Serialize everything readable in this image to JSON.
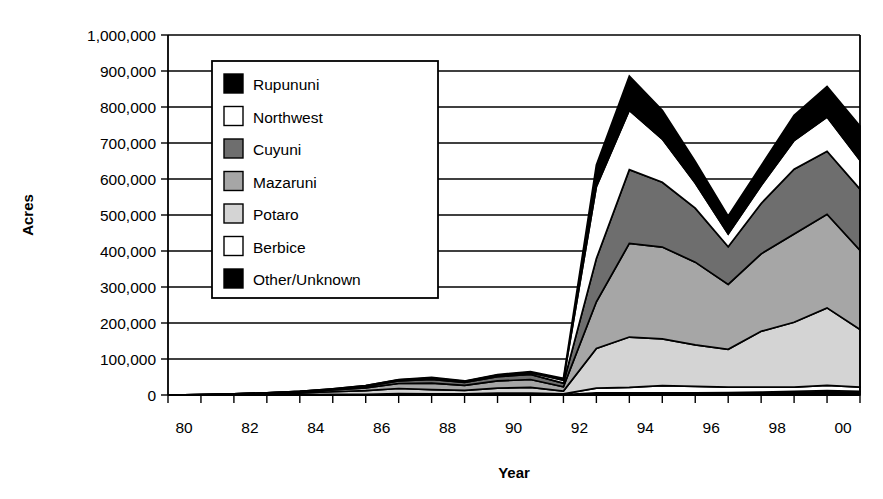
{
  "chart_data": {
    "type": "area",
    "stacked": true,
    "title": "",
    "xlabel": "Year",
    "ylabel": "Acres",
    "x": [
      1980,
      1981,
      1982,
      1983,
      1984,
      1985,
      1986,
      1987,
      1988,
      1989,
      1990,
      1991,
      1992,
      1993,
      1994,
      1995,
      1996,
      1997,
      1998,
      1999,
      2000,
      2001
    ],
    "xtick_labels": [
      "80",
      "82",
      "84",
      "86",
      "88",
      "90",
      "92",
      "94",
      "96",
      "98",
      "00"
    ],
    "xtick_values": [
      1980,
      1982,
      1984,
      1986,
      1988,
      1990,
      1992,
      1994,
      1996,
      1998,
      2000
    ],
    "xlim": [
      1980,
      2001
    ],
    "ytick_labels": [
      "0",
      "100,000",
      "200,000",
      "300,000",
      "400,000",
      "500,000",
      "600,000",
      "700,000",
      "800,000",
      "900,000",
      "1,000,000"
    ],
    "ytick_values": [
      0,
      100000,
      200000,
      300000,
      400000,
      500000,
      600000,
      700000,
      800000,
      900000,
      1000000
    ],
    "ylim": [
      0,
      1000000
    ],
    "grid": true,
    "legend_position": "upper-left-inside",
    "stack_order_bottom_to_top": [
      "Other/Unknown",
      "Berbice",
      "Potaro",
      "Mazaruni",
      "Cuyuni",
      "Northwest",
      "Rupununi"
    ],
    "series": [
      {
        "name": "Rupununi",
        "color": "#000000",
        "values": [
          0,
          0,
          0,
          0,
          0,
          0,
          0,
          1000,
          2000,
          1000,
          2000,
          3000,
          5000,
          60000,
          95000,
          80000,
          60000,
          50000,
          55000,
          70000,
          85000,
          95000
        ]
      },
      {
        "name": "Northwest",
        "color": "#ffffff",
        "values": [
          0,
          0,
          0,
          0,
          0,
          1000,
          2000,
          3000,
          4000,
          3000,
          4000,
          5000,
          8000,
          200000,
          165000,
          120000,
          70000,
          35000,
          50000,
          80000,
          95000,
          80000
        ]
      },
      {
        "name": "Cuyuni",
        "color": "#6e6e6e",
        "values": [
          0,
          0,
          0,
          0,
          1000,
          2000,
          4000,
          7000,
          10000,
          8000,
          12000,
          14000,
          10000,
          120000,
          205000,
          180000,
          150000,
          105000,
          140000,
          180000,
          175000,
          170000
        ]
      },
      {
        "name": "Mazaruni",
        "color": "#a6a6a6",
        "values": [
          0,
          0,
          1000,
          2000,
          3000,
          5000,
          8000,
          14000,
          18000,
          14000,
          20000,
          22000,
          12000,
          130000,
          260000,
          255000,
          230000,
          180000,
          215000,
          245000,
          260000,
          220000
        ]
      },
      {
        "name": "Potaro",
        "color": "#d4d4d4",
        "values": [
          0,
          1000,
          2000,
          3000,
          5000,
          7000,
          10000,
          14000,
          12000,
          10000,
          14000,
          16000,
          8000,
          110000,
          140000,
          130000,
          115000,
          105000,
          155000,
          180000,
          215000,
          160000
        ]
      },
      {
        "name": "Berbice",
        "color": "#ffffff",
        "values": [
          0,
          0,
          0,
          1000,
          1000,
          2000,
          2000,
          3000,
          2000,
          2000,
          3000,
          3000,
          2000,
          13000,
          15000,
          20000,
          18000,
          15000,
          14000,
          12000,
          15000,
          12000
        ]
      },
      {
        "name": "Other/Unknown",
        "color": "#000000",
        "values": [
          0,
          0,
          0,
          0,
          0,
          0,
          0,
          1000,
          1000,
          1000,
          2000,
          2000,
          1000,
          6000,
          6000,
          6000,
          6000,
          7000,
          8000,
          10000,
          12000,
          10000
        ]
      }
    ],
    "legend_entries": [
      {
        "label": "Rupununi",
        "color": "#000000"
      },
      {
        "label": "Northwest",
        "color": "#ffffff"
      },
      {
        "label": "Cuyuni",
        "color": "#6e6e6e"
      },
      {
        "label": "Mazaruni",
        "color": "#a6a6a6"
      },
      {
        "label": "Potaro",
        "color": "#d4d4d4"
      },
      {
        "label": "Berbice",
        "color": "#ffffff"
      },
      {
        "label": "Other/Unknown",
        "color": "#000000"
      }
    ],
    "annotations": {
      "peak_year": 1994,
      "peak_total": 905000,
      "trough_year": 1997,
      "trough_total": 470000,
      "final_year": 2001,
      "final_total": 875000
    }
  }
}
